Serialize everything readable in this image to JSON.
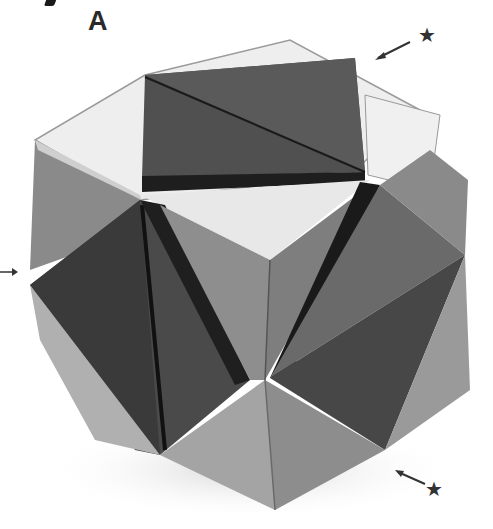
{
  "figure": {
    "label": "A",
    "markers": [
      {
        "name": "star-marker-top-right",
        "glyph": "★",
        "position": "top-right"
      },
      {
        "name": "arrow-marker-left",
        "glyph": "→",
        "position": "left"
      },
      {
        "name": "star-marker-bottom-right",
        "glyph": "★",
        "position": "bottom-right"
      }
    ]
  },
  "palette": {
    "background": "#ffffff",
    "light_face": "#ececec",
    "mid_face": "#9a9a9a",
    "dark_face": "#555555",
    "darkest": "#2a2a2a"
  }
}
